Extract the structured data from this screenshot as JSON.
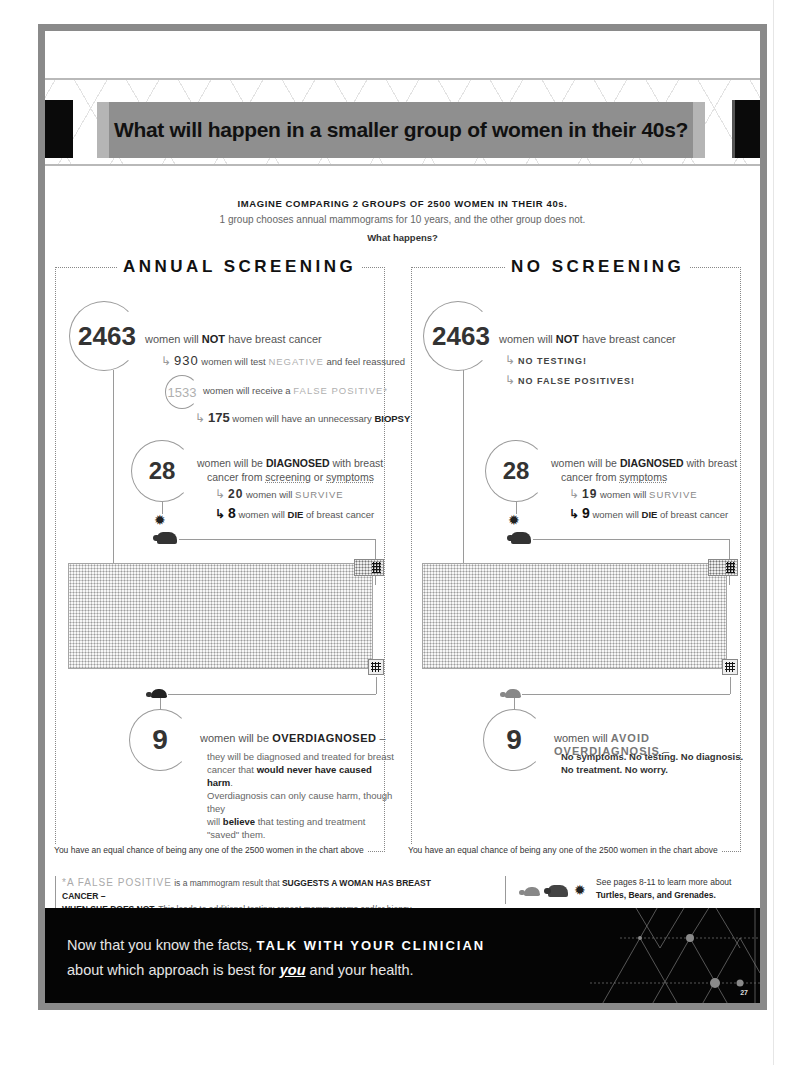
{
  "header": {
    "title": "What will happen in a smaller group of women in their 40s?"
  },
  "intro": {
    "heading": "IMAGINE COMPARING 2 GROUPS OF 2500 WOMEN IN THEIR 40s.",
    "subheading": "1 group chooses annual mammograms for 10 years, and the other group does not.",
    "question": "What happens?"
  },
  "annual": {
    "title": "ANNUAL SCREENING",
    "no_cancer": {
      "count": "2463",
      "text_pre": "women will ",
      "text_bold": "NOT",
      "text_post": " have breast cancer"
    },
    "negative": {
      "count": "930",
      "text_pre": "women will test ",
      "keyword": "NEGATIVE",
      "text_post": " and feel reassured"
    },
    "false_positive": {
      "count": "1533",
      "text_pre": "women will receive a ",
      "keyword": "FALSE POSITIVE*"
    },
    "biopsy": {
      "count": "175",
      "text_pre": "women will have an unnecessary ",
      "keyword": "BIOPSY"
    },
    "diagnosed": {
      "count": "28",
      "line1_pre": "women will be ",
      "line1_bold": "DIAGNOSED",
      "line1_post": " with breast",
      "line2_pre": "cancer from ",
      "line2_u1": "screening",
      "line2_mid": " or ",
      "line2_u2": "symptoms"
    },
    "survive": {
      "count": "20",
      "text_pre": "women will ",
      "keyword": "SURVIVE"
    },
    "die": {
      "count": "8",
      "text_pre": "women will ",
      "keyword": "DIE",
      "text_post": " of breast cancer"
    },
    "overdiagnosed": {
      "count": "9",
      "head_pre": "women will be ",
      "head_bold": "OVERDIAGNOSED",
      "head_post": " –",
      "body1": "they will be diagnosed and treated for breast",
      "body2_pre": "cancer that ",
      "body2_bold": "would never have caused harm",
      "body2_post": ".",
      "body3": "Overdiagnosis can only cause harm, though they",
      "body4_pre": "will ",
      "body4_bold": "believe",
      "body4_post": " that testing and treatment \"saved\" them."
    },
    "equal_chance": "You have an equal chance of being any one of the 2500 women in the chart above"
  },
  "none": {
    "title": "NO SCREENING",
    "no_cancer": {
      "count": "2463",
      "text_pre": "women will ",
      "text_bold": "NOT",
      "text_post": " have breast cancer"
    },
    "no_testing": "NO TESTING!",
    "no_false_positives": "NO FALSE POSITIVES!",
    "diagnosed": {
      "count": "28",
      "line1_pre": "women will be ",
      "line1_bold": "DIAGNOSED",
      "line1_post": " with breast",
      "line2_pre": "cancer from ",
      "line2_u1": "symptoms"
    },
    "survive": {
      "count": "19",
      "text_pre": "women will ",
      "keyword": "SURVIVE"
    },
    "die": {
      "count": "9",
      "text_pre": "women will ",
      "keyword": "DIE",
      "text_post": " of breast cancer"
    },
    "avoid": {
      "count": "9",
      "head_pre": "women will ",
      "head_bold": "AVOID OVERDIAGNOSIS",
      "head_post": " –",
      "body1": "No symptoms. No testing. No diagnosis.",
      "body2": "No treatment. No worry."
    },
    "equal_chance": "You have an equal chance of being any one of the 2500 women in the chart above"
  },
  "footnote": {
    "marker": "*",
    "term": "A FALSE POSITIVE",
    "text1": " is a mammogram result that ",
    "bold1": "SUGGESTS A WOMAN HAS BREAST CANCER –",
    "bold2": "WHEN SHE DOES NOT.",
    "text2": " This leads to additional testing: repeat mammograms and/or biopsy."
  },
  "see_pages": {
    "line1": "See pages 8-11 to learn more about",
    "line2": "Turtles, Bears, and Grenades.",
    "icons": [
      "turtle-icon",
      "bear-icon",
      "grenade-icon"
    ]
  },
  "cta": {
    "line1_pre": "Now that you know the facts, ",
    "line1_bold": "TALK WITH YOUR CLINICIAN",
    "line2_pre": "about which approach is best for ",
    "line2_em": "you",
    "line2_post": " and your health."
  },
  "page_number": "27",
  "colors": {
    "frame": "#8a8a8a",
    "title_band": "#8f8f8f",
    "cta_background": "#050505",
    "text_dark": "#222222",
    "text_light": "#b0b0b0"
  }
}
